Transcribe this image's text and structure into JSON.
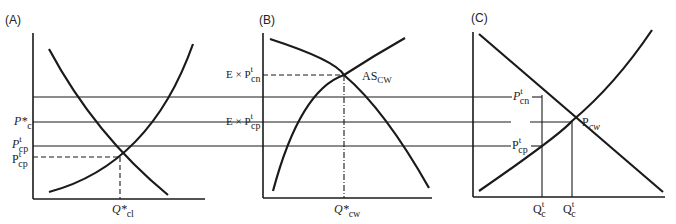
{
  "figure": {
    "panels": [
      {
        "id": "A",
        "label": "(A)",
        "y_labels": {
          "p_star_c": {
            "base": "P*",
            "sub": "c"
          },
          "p_t_cp_upper": {
            "base": "P",
            "sup": "t",
            "sub": "cp"
          },
          "p_t_cp_lower": {
            "base": "P",
            "sup": "t",
            "sub": "cp"
          }
        },
        "x_label": {
          "base": "Q*",
          "sub": "cl"
        }
      },
      {
        "id": "B",
        "label": "(B)",
        "y_labels": {
          "e_p_t_cn": {
            "base": "E × P",
            "sup": "t",
            "sub": "cn"
          },
          "e_p_t_cp": {
            "base": "E × P",
            "sup": "t",
            "sub": "cp"
          }
        },
        "curve_label": {
          "base": "AS",
          "sub": "CW"
        },
        "x_label": {
          "base": "Q*",
          "sub": "cw"
        }
      },
      {
        "id": "C",
        "label": "(C)",
        "y_labels": {
          "p_t_cn": {
            "base": "P",
            "sup": "t",
            "sub": "cn"
          },
          "p_t_cp": {
            "base": "P",
            "sup": "t",
            "sub": "cp"
          }
        },
        "point_label": {
          "base": "P",
          "sub": "cw"
        },
        "x_labels": [
          {
            "base": "Q",
            "sup": "t",
            "sub": "c"
          },
          {
            "base": "Q",
            "sup": "t",
            "sub": "c"
          }
        ]
      }
    ]
  }
}
